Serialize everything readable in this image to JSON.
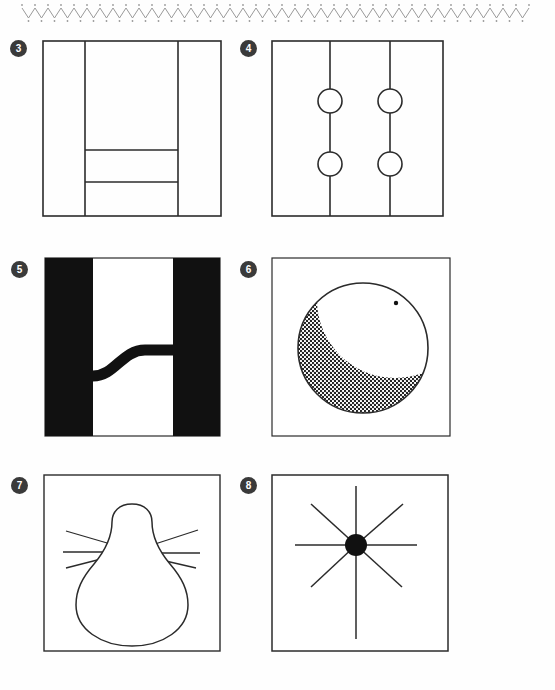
{
  "page": {
    "background_color": "#fefefe",
    "ink_color": "#2b2b2b",
    "badge_color": "#3a3a3a",
    "badge_text_color": "#ffffff",
    "width": 555,
    "height": 690
  },
  "top_border": {
    "name": "zigzag-dot-border",
    "style": "scalloped zigzag with dots",
    "color": "#9a9a9a",
    "x_start": 22,
    "x_end": 532,
    "y": 13,
    "amplitude": 5,
    "period": 13
  },
  "panels": [
    {
      "number": "3",
      "badge_label": "3",
      "caption": "",
      "figure": "vertical-bands-with-stacked-bars",
      "frame": {
        "x": 43,
        "y": 41,
        "w": 178,
        "h": 175
      },
      "lines": [
        {
          "name": "vertical-divider-left",
          "x1": 85,
          "y1": 41,
          "x2": 85,
          "y2": 216
        },
        {
          "name": "vertical-divider-right",
          "x1": 178,
          "y1": 41,
          "x2": 178,
          "y2": 216
        },
        {
          "name": "horizontal-divider-upper",
          "x1": 85,
          "y1": 150,
          "x2": 178,
          "y2": 150
        },
        {
          "name": "horizontal-divider-lower",
          "x1": 85,
          "y1": 182,
          "x2": 178,
          "y2": 182
        }
      ]
    },
    {
      "number": "4",
      "badge_label": "4",
      "caption": "",
      "figure": "two-vertical-lines-with-four-circles",
      "frame": {
        "x": 272,
        "y": 41,
        "w": 171,
        "h": 175
      },
      "lines": [
        {
          "name": "vertical-line-left",
          "x1": 330,
          "y1": 41,
          "x2": 330,
          "y2": 216
        },
        {
          "name": "vertical-line-right",
          "x1": 390,
          "y1": 41,
          "x2": 390,
          "y2": 216
        }
      ],
      "circles": [
        {
          "name": "circle-top-left",
          "cx": 330,
          "cy": 101,
          "r": 12
        },
        {
          "name": "circle-top-right",
          "cx": 390,
          "cy": 101,
          "r": 12
        },
        {
          "name": "circle-bottom-left",
          "cx": 330,
          "cy": 164,
          "r": 12
        },
        {
          "name": "circle-bottom-right",
          "cx": 390,
          "cy": 164,
          "r": 12
        }
      ]
    },
    {
      "number": "5",
      "badge_label": "5",
      "caption": "",
      "figure": "black-bars-with-s-curve",
      "frame": {
        "x": 45,
        "y": 258,
        "w": 175,
        "h": 178
      },
      "bars": [
        {
          "name": "black-bar-left",
          "x": 45,
          "y": 258,
          "w": 48,
          "h": 178,
          "fill": "#111111"
        },
        {
          "name": "black-bar-right",
          "x": 173,
          "y": 258,
          "w": 47,
          "h": 178,
          "fill": "#111111"
        }
      ],
      "curve": {
        "name": "s-curve-connector",
        "stroke_width": 11,
        "from": {
          "x": 93,
          "y": 376
        },
        "to": {
          "x": 174,
          "y": 350
        }
      }
    },
    {
      "number": "6",
      "badge_label": "6",
      "caption": "",
      "figure": "stippled-circle-with-white-crescent-and-dot",
      "frame": {
        "x": 272,
        "y": 258,
        "w": 178,
        "h": 178
      },
      "circle": {
        "name": "stippled-circle",
        "cx": 363,
        "cy": 348,
        "r": 65
      },
      "crescent": {
        "name": "white-crescent-region",
        "cx": 395,
        "cy": 300,
        "r": 78
      },
      "dot": {
        "name": "small-black-dot",
        "cx": 396,
        "cy": 303,
        "r": 2
      },
      "fill_pattern": "dot-stipple"
    },
    {
      "number": "7",
      "badge_label": "7",
      "caption": "",
      "figure": "pear-blob-with-six-whiskers",
      "frame": {
        "x": 44,
        "y": 475,
        "w": 176,
        "h": 176
      },
      "blob": {
        "name": "pear-outline",
        "cx": 132,
        "cy": 565
      },
      "whiskers": [
        {
          "name": "whisker-left-upper",
          "x1": 66,
          "y1": 531,
          "x2": 113,
          "y2": 545
        },
        {
          "name": "whisker-left-middle",
          "x1": 63,
          "y1": 552,
          "x2": 106,
          "y2": 552
        },
        {
          "name": "whisker-left-lower",
          "x1": 66,
          "y1": 568,
          "x2": 104,
          "y2": 558
        },
        {
          "name": "whisker-right-upper",
          "x1": 152,
          "y1": 545,
          "x2": 198,
          "y2": 530
        },
        {
          "name": "whisker-right-middle",
          "x1": 158,
          "y1": 553,
          "x2": 200,
          "y2": 553
        },
        {
          "name": "whisker-right-lower",
          "x1": 157,
          "y1": 559,
          "x2": 196,
          "y2": 568
        }
      ]
    },
    {
      "number": "8",
      "badge_label": "8",
      "caption": "",
      "figure": "eight-spoke-star-with-black-hub",
      "frame": {
        "x": 272,
        "y": 475,
        "w": 176,
        "h": 176
      },
      "hub": {
        "name": "black-hub-circle",
        "cx": 356,
        "cy": 545,
        "r": 11,
        "fill": "#111111"
      },
      "spokes": [
        {
          "name": "spoke-north",
          "x1": 356,
          "y1": 486,
          "x2": 356,
          "y2": 545
        },
        {
          "name": "spoke-south",
          "x1": 356,
          "y1": 545,
          "x2": 356,
          "y2": 639
        },
        {
          "name": "spoke-east",
          "x1": 356,
          "y1": 545,
          "x2": 417,
          "y2": 545
        },
        {
          "name": "spoke-west",
          "x1": 295,
          "y1": 545,
          "x2": 356,
          "y2": 545
        },
        {
          "name": "spoke-northeast",
          "x1": 356,
          "y1": 545,
          "x2": 403,
          "y2": 504
        },
        {
          "name": "spoke-northwest",
          "x1": 311,
          "y1": 504,
          "x2": 356,
          "y2": 545
        },
        {
          "name": "spoke-southeast",
          "x1": 356,
          "y1": 545,
          "x2": 402,
          "y2": 587
        },
        {
          "name": "spoke-southwest",
          "x1": 311,
          "y1": 587,
          "x2": 356,
          "y2": 545
        }
      ]
    }
  ]
}
